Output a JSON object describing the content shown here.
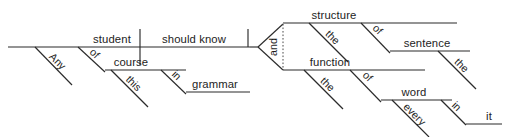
{
  "diagram": {
    "type": "reed-kellogg-sentence-diagram",
    "sentence": "Any student of this course should know in grammar the structure of the sentence and the function of every word in it",
    "ink_color": "#1d1d1d",
    "background_color": "#ffffff",
    "main_clause": {
      "subject": "student",
      "predicate": "should know"
    },
    "words": {
      "any": "Any",
      "student": "student",
      "of1": "of",
      "course": "course",
      "this": "this",
      "in1": "in",
      "grammar": "grammar",
      "should_know": "should know",
      "and": "and",
      "structure": "structure",
      "the1": "the",
      "of2": "of",
      "sentence": "sentence",
      "the2": "the",
      "function": "function",
      "the3": "the",
      "of3": "of",
      "word": "word",
      "every": "every",
      "in2": "in",
      "it": "it"
    }
  }
}
